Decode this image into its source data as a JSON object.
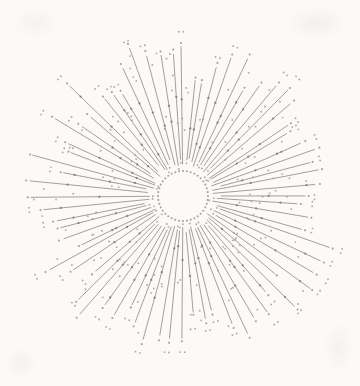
{
  "artwork": {
    "description": "hand-drawn style radial sunburst of thin gray rays with stippled dots around a dotted inner circle on off-white paper",
    "canvas": {
      "width": 360,
      "height": 386
    },
    "background_color": "#fbfaf8",
    "center": {
      "x": 183,
      "y": 196
    },
    "seed": 1337,
    "inner_ring": {
      "radius": 25,
      "dot_count": 40,
      "dot_radius": 1.05,
      "color": "#96938e"
    },
    "rays": {
      "count": 72,
      "angle_jitter_deg": 1.2,
      "inner_radius_min": 30,
      "inner_radius_max": 40,
      "outer_radius_min": 112,
      "outer_radius_max": 158,
      "stroke_color": "#8d8a86",
      "stroke_width": 0.9,
      "stroke_opacity": 0.9
    },
    "inner_tip_dots": {
      "probability": 0.45,
      "inset": 3.5,
      "radius": 0.95,
      "color": "#9a978f"
    },
    "tip_dots": {
      "offset_min": 2.5,
      "offset_max": 5.5,
      "radius": 1.05,
      "color": "#93908a"
    },
    "bead_dots": {
      "min_per_ray": 1,
      "max_per_ray": 2,
      "radius": 1.15,
      "color": "#7d7a75"
    },
    "scatter_dots": {
      "min_per_ray": 1,
      "max_per_ray": 3,
      "radius": 0.95,
      "perp_offset_min": 2,
      "perp_offset_max": 7,
      "color": "#9c9892"
    },
    "outer_pair_dots": {
      "probability": 0.55,
      "beyond_tip_min": 7,
      "beyond_tip_max": 17,
      "gap": 4.5,
      "radius": 0.95,
      "color": "#9c9892"
    }
  }
}
